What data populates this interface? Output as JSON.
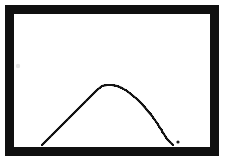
{
  "figure": {
    "title": "",
    "background_color": "#ffffff",
    "width": 226,
    "height": 166,
    "frame": {
      "name": "rectangular-border",
      "color": "#101010",
      "stroke_width": 9,
      "outer_left": 5,
      "outer_top": 5,
      "outer_right": 219,
      "outer_bottom": 156
    },
    "plot_area": {
      "left": 14,
      "top": 14,
      "right": 210,
      "bottom": 145,
      "color": "#ffffff"
    },
    "curve": {
      "name": "parabolic-arc",
      "color": "#141414",
      "stroke_width": 2,
      "style": "hand-drawn-pixelated",
      "apex_x": 107,
      "apex_y": 85,
      "left_base_x": 42,
      "right_base_x": 173,
      "base_y": 145
    },
    "stray_dot": {
      "name": "ink-dot",
      "x": 178,
      "y": 142,
      "radius": 1.6,
      "color": "#1a1a1a"
    },
    "smudge": {
      "name": "faint-smudge",
      "x": 18,
      "y": 66,
      "radius": 2.2,
      "color": "#e2e2e2"
    }
  },
  "chart_data": {
    "type": "line",
    "title": "",
    "xlabel": "",
    "ylabel": "",
    "grid": false,
    "legend": false,
    "axis_visible": false,
    "xlim": [
      42,
      173
    ],
    "ylim": [
      85,
      145
    ],
    "x": [
      42,
      47,
      52,
      57,
      62,
      67,
      72,
      77,
      82,
      87,
      92,
      97,
      102,
      107,
      112,
      117,
      122,
      127,
      132,
      137,
      142,
      147,
      152,
      157,
      162,
      167,
      173
    ],
    "y": [
      145,
      140,
      135,
      130,
      125,
      120,
      115,
      110,
      105,
      100,
      95,
      90,
      86,
      85,
      85,
      86,
      88,
      91,
      95,
      99,
      104,
      110,
      116,
      123,
      131,
      139,
      145
    ],
    "series": [
      {
        "name": "arc",
        "values": [
          145,
          140,
          135,
          130,
          125,
          120,
          115,
          110,
          105,
          100,
          95,
          90,
          86,
          85,
          85,
          86,
          88,
          91,
          95,
          99,
          104,
          110,
          116,
          123,
          131,
          139,
          145
        ]
      }
    ]
  }
}
